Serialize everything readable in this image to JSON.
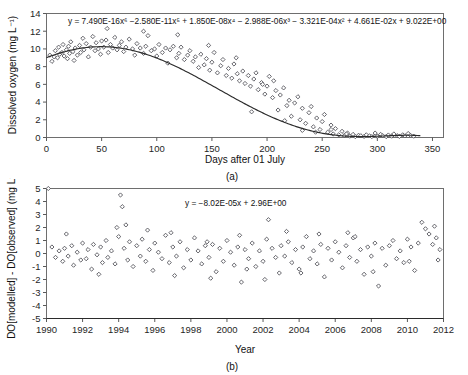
{
  "figure": {
    "background_color": "#ffffff",
    "marker_color": "#4a4a52",
    "line_color": "#2b2b2b"
  },
  "panel_a": {
    "label": "(a)",
    "equation": "y = 7.490E-16x⁶ −2.580E-11x⁵ + 1.850E-08x⁴ − 2.988E-06x³ − 3.321E-04x² + 4.661E-02x + 9.022E+00",
    "ylabel": "Dissolved oxygen (mg L⁻¹)",
    "xlabel": "Days after 01 July"
  },
  "panel_b": {
    "label": "(b)",
    "equation": "y = −8.02E-05x + 2.96E+00",
    "ylabel": "DO[modelled] - DO[observed] (mg L⁻¹)",
    "xlabel": "Year"
  },
  "chart_data": [
    {
      "type": "scatter",
      "title": "",
      "panel": "(a)",
      "xlabel": "Days after 01 July",
      "ylabel": "Dissolved oxygen (mg L-1)",
      "xlim": [
        0,
        360
      ],
      "ylim": [
        0,
        14
      ],
      "xticks": [
        0,
        50,
        100,
        150,
        200,
        250,
        300,
        350
      ],
      "yticks": [
        0,
        2,
        4,
        6,
        8,
        10,
        12,
        14
      ],
      "grid": false,
      "legend": "none",
      "annotations": [
        "y = 7.490E-16x6 -2.580E-11x5 + 1.850E-08x4 - 2.988E-06x3 - 3.321E-04x2 + 4.661E-02x + 9.022E+00"
      ],
      "fit": {
        "kind": "polynomial",
        "degree": 6,
        "coefficients_desc": [
          7.49e-16,
          -2.58e-11,
          1.85e-08,
          -2.988e-06,
          -0.0003321,
          0.04661,
          9.022
        ],
        "equation": "y = 7.490E-16x^6 - 2.580E-11x^5 + 1.850E-08x^4 - 2.988E-06x^3 - 3.321E-04x^2 + 4.661E-02x + 9.022E+00"
      },
      "points": [
        [
          3,
          9.3
        ],
        [
          5,
          8.6
        ],
        [
          7,
          9.1
        ],
        [
          8,
          9.8
        ],
        [
          10,
          9.0
        ],
        [
          11,
          10.2
        ],
        [
          12,
          9.4
        ],
        [
          14,
          9.6
        ],
        [
          15,
          10.5
        ],
        [
          16,
          9.2
        ],
        [
          18,
          9.9
        ],
        [
          19,
          8.9
        ],
        [
          20,
          10.3
        ],
        [
          21,
          9.5
        ],
        [
          22,
          10.8
        ],
        [
          24,
          9.7
        ],
        [
          25,
          8.7
        ],
        [
          26,
          10.1
        ],
        [
          28,
          9.3
        ],
        [
          30,
          10.4
        ],
        [
          31,
          9.6
        ],
        [
          33,
          11.2
        ],
        [
          34,
          9.9
        ],
        [
          36,
          10.6
        ],
        [
          38,
          9.1
        ],
        [
          40,
          10.2
        ],
        [
          42,
          11.4
        ],
        [
          44,
          9.8
        ],
        [
          45,
          10.7
        ],
        [
          47,
          10.0
        ],
        [
          49,
          9.4
        ],
        [
          50,
          10.9
        ],
        [
          52,
          10.2
        ],
        [
          54,
          11.0
        ],
        [
          56,
          9.6
        ],
        [
          58,
          10.5
        ],
        [
          60,
          10.1
        ],
        [
          62,
          11.3
        ],
        [
          64,
          9.9
        ],
        [
          66,
          10.4
        ],
        [
          68,
          10.8
        ],
        [
          70,
          9.7
        ],
        [
          72,
          10.2
        ],
        [
          75,
          11.1
        ],
        [
          78,
          10.0
        ],
        [
          80,
          9.3
        ],
        [
          82,
          10.6
        ],
        [
          85,
          10.1
        ],
        [
          88,
          9.5
        ],
        [
          90,
          10.3
        ],
        [
          92,
          11.5
        ],
        [
          95,
          9.8
        ],
        [
          98,
          10.0
        ],
        [
          100,
          9.2
        ],
        [
          102,
          10.5
        ],
        [
          105,
          9.6
        ],
        [
          108,
          10.1
        ],
        [
          110,
          8.4
        ],
        [
          112,
          9.9
        ],
        [
          115,
          10.3
        ],
        [
          118,
          9.0
        ],
        [
          120,
          9.5
        ],
        [
          122,
          10.2
        ],
        [
          125,
          8.8
        ],
        [
          128,
          9.3
        ],
        [
          130,
          9.8
        ],
        [
          133,
          8.6
        ],
        [
          135,
          9.1
        ],
        [
          138,
          7.9
        ],
        [
          140,
          9.4
        ],
        [
          143,
          8.2
        ],
        [
          145,
          8.9
        ],
        [
          148,
          7.6
        ],
        [
          150,
          8.5
        ],
        [
          152,
          9.6
        ],
        [
          155,
          7.3
        ],
        [
          158,
          8.1
        ],
        [
          160,
          8.8
        ],
        [
          163,
          7.0
        ],
        [
          165,
          7.8
        ],
        [
          168,
          6.7
        ],
        [
          170,
          8.3
        ],
        [
          173,
          7.2
        ],
        [
          175,
          6.4
        ],
        [
          178,
          7.5
        ],
        [
          180,
          6.1
        ],
        [
          183,
          7.0
        ],
        [
          185,
          5.8
        ],
        [
          188,
          6.6
        ],
        [
          190,
          7.3
        ],
        [
          192,
          5.4
        ],
        [
          195,
          6.2
        ],
        [
          198,
          4.9
        ],
        [
          200,
          5.8
        ],
        [
          202,
          6.9
        ],
        [
          205,
          4.5
        ],
        [
          208,
          5.3
        ],
        [
          210,
          3.1
        ],
        [
          212,
          4.8
        ],
        [
          215,
          5.6
        ],
        [
          218,
          3.6
        ],
        [
          220,
          4.2
        ],
        [
          222,
          2.4
        ],
        [
          225,
          3.9
        ],
        [
          228,
          4.6
        ],
        [
          230,
          2.0
        ],
        [
          232,
          3.3
        ],
        [
          235,
          1.6
        ],
        [
          238,
          2.8
        ],
        [
          240,
          3.5
        ],
        [
          242,
          1.2
        ],
        [
          245,
          2.2
        ],
        [
          248,
          0.9
        ],
        [
          250,
          1.8
        ],
        [
          252,
          2.6
        ],
        [
          255,
          0.6
        ],
        [
          258,
          1.4
        ],
        [
          260,
          0.4
        ],
        [
          262,
          1.0
        ],
        [
          265,
          0.3
        ],
        [
          268,
          0.7
        ],
        [
          270,
          0.2
        ],
        [
          273,
          0.5
        ],
        [
          275,
          0.15
        ],
        [
          278,
          0.35
        ],
        [
          280,
          0.1
        ],
        [
          283,
          0.25
        ],
        [
          285,
          0.2
        ],
        [
          288,
          0.12
        ],
        [
          290,
          0.3
        ],
        [
          293,
          0.18
        ],
        [
          295,
          0.1
        ],
        [
          298,
          0.22
        ],
        [
          300,
          0.15
        ],
        [
          303,
          0.35
        ],
        [
          305,
          0.2
        ],
        [
          308,
          0.1
        ],
        [
          310,
          0.28
        ],
        [
          313,
          0.15
        ],
        [
          315,
          0.4
        ],
        [
          318,
          0.2
        ],
        [
          320,
          0.12
        ],
        [
          323,
          0.3
        ],
        [
          325,
          0.18
        ],
        [
          328,
          0.45
        ],
        [
          330,
          0.25
        ],
        [
          333,
          0.15
        ],
        [
          196,
          6.0
        ],
        [
          186,
          2.9
        ],
        [
          206,
          6.4
        ],
        [
          216,
          1.9
        ],
        [
          172,
          9.0
        ],
        [
          147,
          10.4
        ],
        [
          119,
          11.6
        ],
        [
          88,
          12.0
        ],
        [
          55,
          12.3
        ],
        [
          298,
          0.5
        ],
        [
          232,
          0.8
        ],
        [
          244,
          0.6
        ],
        [
          258,
          0.9
        ],
        [
          272,
          0.4
        ]
      ]
    },
    {
      "type": "scatter",
      "title": "",
      "panel": "(b)",
      "xlabel": "Year",
      "ylabel": "DO[modelled] - DO[observed] (mg L-1)",
      "xlim": [
        1990,
        2012
      ],
      "ylim": [
        -5,
        5
      ],
      "xticks": [
        1990,
        1992,
        1994,
        1996,
        1998,
        2000,
        2002,
        2004,
        2006,
        2008,
        2010,
        2012
      ],
      "yticks": [
        -5,
        -4,
        -3,
        -2,
        -1,
        0,
        1,
        2,
        3,
        4,
        5
      ],
      "grid": false,
      "legend": "none",
      "annotations": [
        "y = -8.02E-05x + 2.96E+00"
      ],
      "fit": {
        "kind": "linear",
        "slope": -8.02e-05,
        "intercept": 2.96,
        "equation": "y = -8.02E-05x + 2.96E+00"
      },
      "points": [
        [
          1990.3,
          0.5
        ],
        [
          1990.5,
          -0.3
        ],
        [
          1990.7,
          0.2
        ],
        [
          1990.9,
          -0.6
        ],
        [
          1991.0,
          0.4
        ],
        [
          1991.2,
          -0.2
        ],
        [
          1991.4,
          0.6
        ],
        [
          1991.5,
          -0.9
        ],
        [
          1991.7,
          0.1
        ],
        [
          1991.9,
          -0.5
        ],
        [
          1992.0,
          0.8
        ],
        [
          1992.2,
          -0.4
        ],
        [
          1992.3,
          0.3
        ],
        [
          1992.5,
          -1.2
        ],
        [
          1992.6,
          0.7
        ],
        [
          1992.8,
          -0.1
        ],
        [
          1993.0,
          0.5
        ],
        [
          1993.1,
          -0.7
        ],
        [
          1993.3,
          1.0
        ],
        [
          1993.4,
          -0.3
        ],
        [
          1993.6,
          0.2
        ],
        [
          1993.8,
          -0.8
        ],
        [
          1994.0,
          1.3
        ],
        [
          1994.1,
          4.5
        ],
        [
          1994.2,
          3.6
        ],
        [
          1994.3,
          0.4
        ],
        [
          1994.5,
          -0.5
        ],
        [
          1994.6,
          0.9
        ],
        [
          1994.8,
          -1.0
        ],
        [
          1995.0,
          0.6
        ],
        [
          1995.2,
          -0.2
        ],
        [
          1995.3,
          1.1
        ],
        [
          1995.5,
          -0.6
        ],
        [
          1995.7,
          0.3
        ],
        [
          1995.9,
          -1.3
        ],
        [
          1996.0,
          0.8
        ],
        [
          1996.2,
          0.1
        ],
        [
          1996.4,
          -0.4
        ],
        [
          1996.6,
          1.4
        ],
        [
          1996.8,
          -0.7
        ],
        [
          1997.0,
          0.5
        ],
        [
          1997.2,
          -0.2
        ],
        [
          1997.4,
          0.9
        ],
        [
          1997.6,
          -1.1
        ],
        [
          1997.8,
          0.3
        ],
        [
          1998.0,
          -0.5
        ],
        [
          1998.2,
          1.2
        ],
        [
          1998.4,
          0.2
        ],
        [
          1998.6,
          -0.8
        ],
        [
          1998.8,
          0.6
        ],
        [
          1999.0,
          -0.3
        ],
        [
          1999.2,
          0.7
        ],
        [
          1999.4,
          -1.4
        ],
        [
          1999.6,
          0.4
        ],
        [
          1999.8,
          -0.6
        ],
        [
          2000.0,
          1.0
        ],
        [
          2000.2,
          0.1
        ],
        [
          2000.4,
          -0.9
        ],
        [
          2000.6,
          0.5
        ],
        [
          2000.8,
          -2.2
        ],
        [
          2001.0,
          0.3
        ],
        [
          2001.2,
          -0.4
        ],
        [
          2001.4,
          0.8
        ],
        [
          2001.6,
          -1.0
        ],
        [
          2001.8,
          0.2
        ],
        [
          2002.0,
          -0.6
        ],
        [
          2002.2,
          1.1
        ],
        [
          2002.3,
          2.6
        ],
        [
          2002.5,
          0.4
        ],
        [
          2002.7,
          -0.3
        ],
        [
          2002.9,
          -1.5
        ],
        [
          2003.0,
          0.6
        ],
        [
          2003.2,
          -0.2
        ],
        [
          2003.4,
          0.9
        ],
        [
          2003.6,
          -0.7
        ],
        [
          2003.8,
          0.3
        ],
        [
          2004.0,
          -1.2
        ],
        [
          2004.2,
          0.5
        ],
        [
          2004.4,
          1.3
        ],
        [
          2004.6,
          -0.4
        ],
        [
          2004.8,
          0.2
        ],
        [
          2005.0,
          -0.8
        ],
        [
          2005.2,
          0.7
        ],
        [
          2005.4,
          -1.8
        ],
        [
          2005.6,
          0.4
        ],
        [
          2005.8,
          -0.5
        ],
        [
          2006.0,
          0.9
        ],
        [
          2006.2,
          0.1
        ],
        [
          2006.4,
          -1.1
        ],
        [
          2006.6,
          0.6
        ],
        [
          2006.8,
          -0.3
        ],
        [
          2007.0,
          1.2
        ],
        [
          2007.2,
          -0.6
        ],
        [
          2007.4,
          0.3
        ],
        [
          2007.6,
          -1.6
        ],
        [
          2007.8,
          0.5
        ],
        [
          2008.0,
          -0.2
        ],
        [
          2008.2,
          0.8
        ],
        [
          2008.4,
          -2.5
        ],
        [
          2008.6,
          0.4
        ],
        [
          2008.8,
          -0.9
        ],
        [
          2009.0,
          0.6
        ],
        [
          2009.2,
          1.0
        ],
        [
          2009.4,
          -0.4
        ],
        [
          2009.6,
          0.2
        ],
        [
          2009.8,
          -0.7
        ],
        [
          2010.0,
          1.1
        ],
        [
          2010.2,
          0.5
        ],
        [
          2010.4,
          -1.3
        ],
        [
          2010.6,
          0.8
        ],
        [
          2010.8,
          2.4
        ],
        [
          2011.0,
          1.9
        ],
        [
          2011.2,
          1.5
        ],
        [
          2011.4,
          0.7
        ],
        [
          2011.5,
          2.1
        ],
        [
          2011.6,
          1.2
        ],
        [
          2011.7,
          -0.5
        ],
        [
          2011.8,
          0.3
        ],
        [
          1991.1,
          1.5
        ],
        [
          1993.9,
          2.0
        ],
        [
          1996.9,
          1.6
        ],
        [
          1999.1,
          -1.9
        ],
        [
          2002.1,
          -2.0
        ],
        [
          2005.1,
          1.5
        ],
        [
          2008.1,
          -1.4
        ],
        [
          1994.4,
          2.2
        ],
        [
          1997.1,
          -1.7
        ],
        [
          2000.7,
          1.4
        ],
        [
          2003.3,
          1.7
        ],
        [
          2006.7,
          1.6
        ],
        [
          1992.9,
          -1.6
        ],
        [
          1995.6,
          1.8
        ],
        [
          1998.9,
          0.9
        ],
        [
          2001.1,
          -1.2
        ],
        [
          2004.1,
          -1.5
        ],
        [
          2007.1,
          1.3
        ],
        [
          2010.1,
          -0.6
        ],
        [
          1990.1,
          5.0
        ]
      ]
    }
  ]
}
